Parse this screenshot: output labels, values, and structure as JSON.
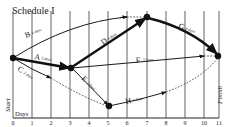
{
  "title": "Schedule I",
  "axis": {
    "label": "Days",
    "ticks": [
      "0",
      "1",
      "2",
      "3",
      "4",
      "5",
      "6",
      "7",
      "8",
      "9",
      "10",
      "11"
    ]
  },
  "nodes": {
    "start": {
      "label": "Start",
      "day": 0
    },
    "n3": {
      "day": 3
    },
    "n5": {
      "day": 5
    },
    "n7": {
      "day": 7
    },
    "finish": {
      "label": "Finish",
      "day": 11
    }
  },
  "activities": [
    {
      "id": "A",
      "letter": "A",
      "duration": "3 days",
      "from": "start",
      "to": "n3",
      "critical": true
    },
    {
      "id": "B",
      "letter": "B",
      "duration": "4 days",
      "from": "start",
      "to": "n7",
      "critical": false
    },
    {
      "id": "C",
      "letter": "C",
      "duration": "2 days",
      "from": "start",
      "to": "n5",
      "critical": false
    },
    {
      "id": "D",
      "letter": "D",
      "duration": "4 days",
      "from": "n3",
      "to": "n7",
      "critical": true
    },
    {
      "id": "E",
      "letter": "E",
      "duration": "2 days",
      "from": "n3",
      "to": "n5",
      "critical": false
    },
    {
      "id": "F",
      "letter": "F",
      "duration": "7 days",
      "from": "n3",
      "to": "finish",
      "critical": false
    },
    {
      "id": "G",
      "letter": "G",
      "duration": "4 days",
      "from": "n7",
      "to": "finish",
      "critical": true
    },
    {
      "id": "H",
      "letter": "H",
      "duration": "3 days",
      "from": "n5",
      "to": "finish",
      "critical": false
    }
  ]
}
